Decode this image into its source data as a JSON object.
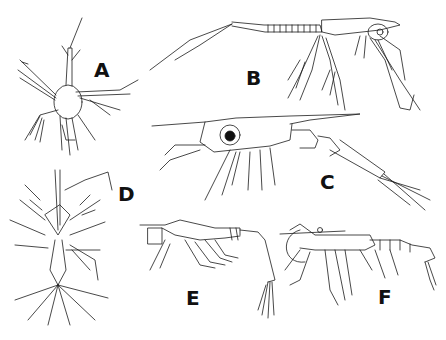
{
  "figure": {
    "background": "#ffffff",
    "ink_color": "#111111",
    "panels": [
      {
        "id": "A",
        "label": "A",
        "subject": "nauplius larva"
      },
      {
        "id": "B",
        "label": "B",
        "subject": "mysis-like larva with long antennae"
      },
      {
        "id": "C",
        "label": "C",
        "subject": "larva with large eye and long rostrum"
      },
      {
        "id": "D",
        "label": "D",
        "subject": "dorsal view of spiny larva"
      },
      {
        "id": "E",
        "label": "E",
        "subject": "larva with box-like carapace"
      },
      {
        "id": "F",
        "label": "F",
        "subject": "shrimp-like postlarva"
      }
    ]
  }
}
